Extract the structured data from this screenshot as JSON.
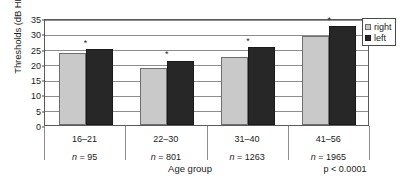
{
  "chart_data": {
    "type": "bar",
    "title": "",
    "xlabel": "Age group",
    "ylabel": "Thresholds (dB HL)",
    "ylim": [
      0,
      35
    ],
    "yticks": [
      0,
      5,
      10,
      15,
      20,
      25,
      30,
      35
    ],
    "ytick_labels": [
      "0",
      "5",
      "10",
      "15",
      "20",
      "25",
      "30",
      "35"
    ],
    "grid": true,
    "legend_position": "top-right",
    "categories": [
      "16–21",
      "22–30",
      "31–40",
      "41–56"
    ],
    "category_counts": [
      "n = 95",
      "n = 801",
      "n = 1263",
      "n = 1965"
    ],
    "series": [
      {
        "name": "right",
        "color": "#c9c9c9",
        "values": [
          23.7,
          18.8,
          22.3,
          29.2
        ]
      },
      {
        "name": "left",
        "color": "#272727",
        "values": [
          24.8,
          21.1,
          25.5,
          32.3
        ]
      }
    ],
    "annotations": {
      "significance_marker": "*",
      "significance_groups": [
        "16–21",
        "22–30",
        "31–40",
        "41–56"
      ],
      "pvalue": "p < 0.0001"
    }
  }
}
